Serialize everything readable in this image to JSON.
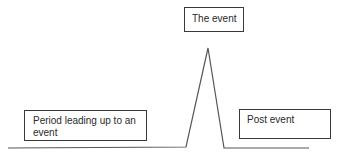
{
  "diagram": {
    "type": "event-timeline-spike",
    "labels": {
      "event": "The event",
      "before": "Period leading up to an event",
      "after": "Post event"
    },
    "colors": {
      "line": "#555555",
      "box_border": "#3a3a3a",
      "text": "#2a2a2a",
      "background": "#ffffff"
    },
    "line_points": [
      [
        8,
        148
      ],
      [
        186,
        147
      ],
      [
        208,
        48
      ],
      [
        224,
        148
      ],
      [
        309,
        148
      ]
    ]
  }
}
